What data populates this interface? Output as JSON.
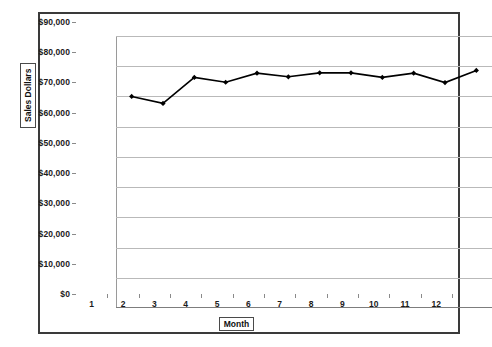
{
  "chart_data": {
    "type": "line",
    "title": "",
    "xlabel": "Month",
    "ylabel": "Sales Dollars",
    "categories": [
      "1",
      "2",
      "3",
      "4",
      "5",
      "6",
      "7",
      "8",
      "9",
      "10",
      "11",
      "12"
    ],
    "x": [
      1,
      2,
      3,
      4,
      5,
      6,
      7,
      8,
      9,
      10,
      11,
      12
    ],
    "values": [
      70000,
      67700,
      76300,
      74700,
      77700,
      76500,
      77800,
      77800,
      76300,
      77700,
      74600,
      78600
    ],
    "ylim": [
      0,
      90000
    ],
    "ytick_values": [
      0,
      10000,
      20000,
      30000,
      40000,
      50000,
      60000,
      70000,
      80000,
      90000
    ],
    "ytick_labels": [
      "$0",
      "$10,000",
      "$20,000",
      "$30,000",
      "$40,000",
      "$50,000",
      "$60,000",
      "$70,000",
      "$80,000",
      "$90,000"
    ],
    "xtick_labels": [
      "1",
      "2",
      "3",
      "4",
      "5",
      "6",
      "7",
      "8",
      "9",
      "10",
      "11",
      "12"
    ],
    "grid": true,
    "legend": false,
    "series_color": "#000000",
    "grid_color": "#b9b9b9",
    "marker": "diamond"
  }
}
